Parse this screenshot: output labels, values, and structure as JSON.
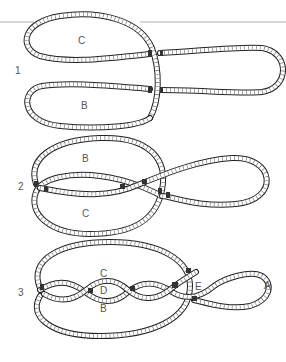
{
  "figure": {
    "type": "knot-tying-diagram",
    "steps": [
      {
        "number": "1",
        "labels": {
          "upper_loop": "C",
          "lower_loop": "B"
        }
      },
      {
        "number": "2",
        "labels": {
          "upper_loop": "B",
          "lower_loop": "C"
        }
      },
      {
        "number": "3",
        "labels": {
          "top": "C",
          "center": "D",
          "bottom": "B",
          "crossing": "E",
          "right_loop": "A"
        }
      }
    ]
  },
  "colors": {
    "rope_outline": "#222222",
    "rope_fill": "#ffffff",
    "label": "#555555",
    "rule": "#9a9a9a"
  }
}
